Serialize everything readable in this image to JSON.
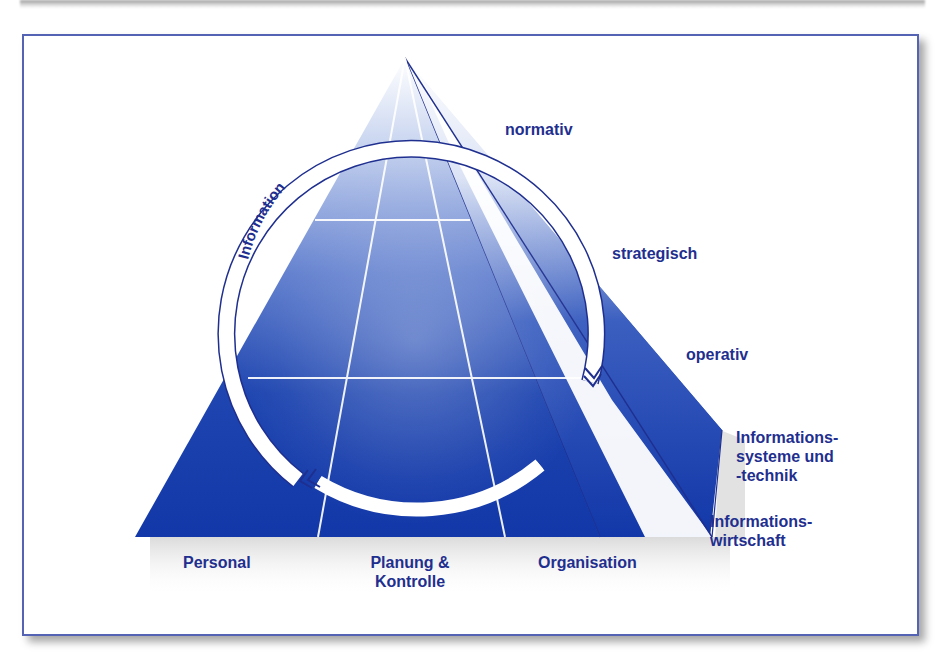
{
  "diagram": {
    "ring_label": "Information",
    "levels": [
      {
        "id": "normativ",
        "label": "normativ"
      },
      {
        "id": "strategisch",
        "label": "strategisch"
      },
      {
        "id": "operativ",
        "label": "operativ"
      }
    ],
    "side_labels": [
      {
        "id": "is-technik",
        "line1": "Informations-",
        "line2": "systeme und",
        "line3": "-technik"
      },
      {
        "id": "info-wirtschaft",
        "line1": "Informations-",
        "line2": "wirtschaft"
      }
    ],
    "base_labels": [
      {
        "id": "personal",
        "line1": "Personal"
      },
      {
        "id": "planung",
        "line1": "Planung &",
        "line2": "Kontrolle"
      },
      {
        "id": "organisation",
        "line1": "Organisation"
      }
    ],
    "colors": {
      "pyramid_dark": "#1237a8",
      "pyramid_light": "#e8eefa",
      "text": "#1f2f8f",
      "frame": "#5563b4"
    }
  }
}
